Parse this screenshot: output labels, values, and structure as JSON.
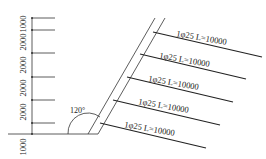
{
  "dims": [
    {
      "label": "1000",
      "y": 24
    },
    {
      "label": "2000",
      "y": 42
    },
    {
      "label": "2000",
      "y": 65
    },
    {
      "label": "2000",
      "y": 88
    },
    {
      "label": "2000",
      "y": 112
    },
    {
      "label": "1000",
      "y": 129
    }
  ],
  "angle": {
    "label": "120°"
  },
  "nails": [
    {
      "label": "1φ25 L=10000"
    },
    {
      "label": "1φ25 L=10000"
    },
    {
      "label": "1φ25 L=10000"
    },
    {
      "label": "1φ25 L=10000"
    },
    {
      "label": "1φ25 L=10000"
    }
  ]
}
